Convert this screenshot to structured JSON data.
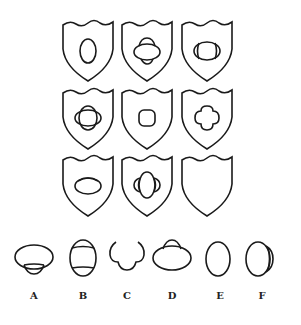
{
  "puzzle": {
    "grid": [
      [
        {
          "id": "r1c1",
          "figure": "vertical-ellipse"
        },
        {
          "id": "r1c2",
          "figure": "horizontal-ellipse-with-top-and-bottom-caps"
        },
        {
          "id": "r1c3",
          "figure": "horizontal-ellipse-with-left-and-right-inner-arcs"
        }
      ],
      [
        {
          "id": "r2c1",
          "figure": "overlapping-horizontal-and-vertical-ellipses"
        },
        {
          "id": "r2c2",
          "figure": "rounded-square"
        },
        {
          "id": "r2c3",
          "figure": "four-lobed-quatrefoil"
        }
      ],
      [
        {
          "id": "r3c1",
          "figure": "horizontal-ellipse-with-top-inner-arc"
        },
        {
          "id": "r3c2",
          "figure": "vertical-ellipse-with-left-and-right-caps"
        },
        {
          "id": "r3c3",
          "figure": "empty (question)"
        }
      ]
    ],
    "options": [
      {
        "label": "A",
        "figure": "horizontal-ellipse-with-bottom-cap"
      },
      {
        "label": "B",
        "figure": "vertical-ellipse-with-top-and-bottom-inner-arcs"
      },
      {
        "label": "C",
        "figure": "open-three-lobed-curve"
      },
      {
        "label": "D",
        "figure": "horizontal-ellipse-with-top-cap"
      },
      {
        "label": "E",
        "figure": "vertical-ellipse"
      },
      {
        "label": "F",
        "figure": "vertical-ellipse-with-right-cap"
      }
    ]
  }
}
